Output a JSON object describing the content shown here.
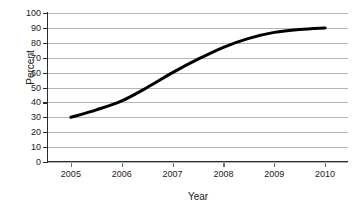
{
  "chart_data": {
    "type": "line",
    "title": "",
    "xlabel": "Year",
    "ylabel": "Percent",
    "xlim": [
      2004.55,
      2010.45
    ],
    "ylim": [
      0,
      100
    ],
    "grid": true,
    "legend": null,
    "x_tick_labels": [
      "2005",
      "2006",
      "2007",
      "2008",
      "2009",
      "2010"
    ],
    "x_ticks": [
      2005,
      2006,
      2007,
      2008,
      2009,
      2010
    ],
    "y_tick_labels": [
      "0",
      "10",
      "20",
      "30",
      "40",
      "50",
      "60",
      "70",
      "80",
      "90",
      "100"
    ],
    "y_ticks": [
      0,
      10,
      20,
      30,
      40,
      50,
      60,
      70,
      80,
      90,
      100
    ],
    "series": [
      {
        "name": "Percent",
        "color": "#000000",
        "line_width": 3,
        "x": [
          2005,
          2005.5,
          2006,
          2006.5,
          2007,
          2007.5,
          2008,
          2008.5,
          2009,
          2009.5,
          2010
        ],
        "values": [
          30,
          35,
          41,
          50,
          60,
          69,
          77,
          83,
          87,
          89,
          90
        ]
      }
    ],
    "annotations": []
  },
  "axes": {
    "y_title": "Percent",
    "x_title": "Year"
  }
}
